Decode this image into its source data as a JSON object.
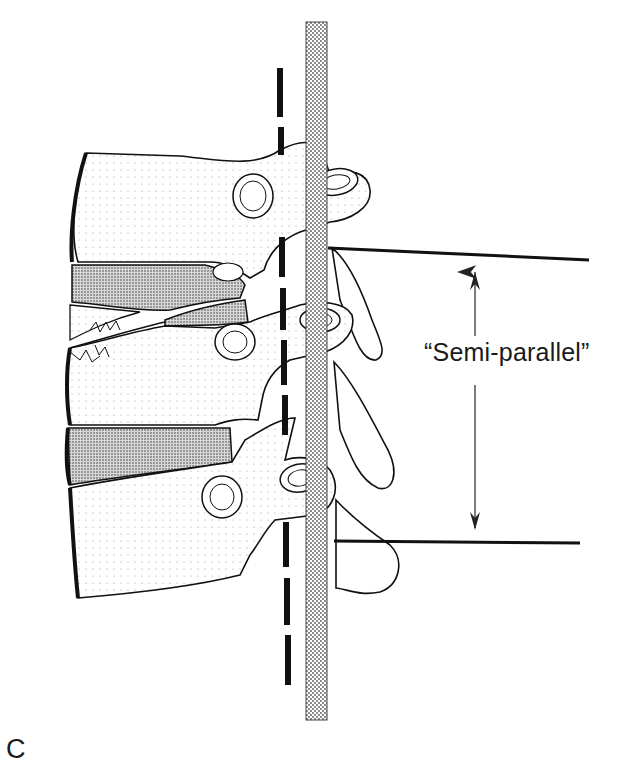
{
  "figure": {
    "panel_letter": "C",
    "annotation_label": "“Semi-parallel”",
    "colors": {
      "ink": "#111111",
      "stipple": "#777777",
      "background": "#ffffff"
    },
    "elements": {
      "vertebrae": [
        "upper-vertebra",
        "middle-vertebra",
        "lower-vertebra"
      ],
      "intervertebral_discs": [
        "upper-disc-degenerated",
        "lower-disc"
      ],
      "reference_lines": [
        "dashed-posterior-line",
        "stippled-rod",
        "upper-horizontal-line",
        "lower-horizontal-line"
      ],
      "arrow": "double-headed-vertical-arrow"
    }
  }
}
